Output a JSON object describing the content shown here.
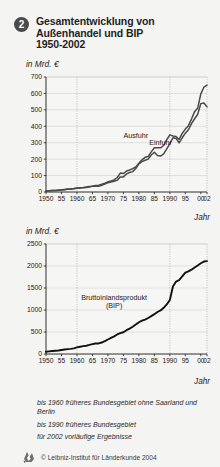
{
  "header": {
    "badge": "2",
    "title_lines": [
      "Gesamtentwicklung von",
      "Außenhandel und BIP",
      "1950-2002"
    ],
    "title_full": "Gesamtentwicklung von Außenhandel und BIP 1950-2002"
  },
  "colors": {
    "background": "#f4f4f2",
    "plot_background": "#f6f6f4",
    "axis": "#1a1a1a",
    "grid": "#c9c9c9",
    "gridline_dotted": "#9a9a9a",
    "series_ausfuhr": "#4a4a4a",
    "series_einfuhr": "#4a4a4a",
    "series_bip": "#111111",
    "badge": "#4b4b4b"
  },
  "notes": [
    "bis 1960 früheres Bundesgebiet ohne Saarland und Berlin",
    "bis 1990 früheres Bundesgebiet",
    "für 2002 vorläufige Ergebnisse"
  ],
  "credit": {
    "text": "© Leibniz-Institut für Länderkunde 2004",
    "logo_icon": "leibniz-logo-icon"
  },
  "chart_data": [
    {
      "id": "aussenhandel",
      "type": "line",
      "title": "",
      "unit_label": "in Mrd. €",
      "xlabel": "Jahr",
      "ylabel": "",
      "xlim": [
        1950,
        2002
      ],
      "ylim": [
        0,
        700
      ],
      "yticks": [
        0,
        100,
        200,
        300,
        400,
        500,
        600,
        700
      ],
      "ytick_labels": [
        "0",
        "100",
        "200",
        "300",
        "400",
        "500",
        "600",
        "700"
      ],
      "xticks": [
        1950,
        1955,
        1960,
        1965,
        1970,
        1975,
        1980,
        1985,
        1990,
        1995,
        2000,
        2002
      ],
      "xtick_labels": [
        "1950",
        "55",
        "1960",
        "65",
        "1970",
        "75",
        "1980",
        "85",
        "1990",
        "95",
        "00",
        "02"
      ],
      "grid": true,
      "vertical_markers": [
        1960,
        1990
      ],
      "legend_position": "inline-annotations",
      "series": [
        {
          "name": "Ausfuhr",
          "label_x": 1979,
          "label_y": 330,
          "x": [
            1950,
            1951,
            1952,
            1953,
            1954,
            1955,
            1956,
            1957,
            1958,
            1959,
            1960,
            1961,
            1962,
            1963,
            1964,
            1965,
            1966,
            1967,
            1968,
            1969,
            1970,
            1971,
            1972,
            1973,
            1974,
            1975,
            1976,
            1977,
            1978,
            1979,
            1980,
            1981,
            1982,
            1983,
            1984,
            1985,
            1986,
            1987,
            1988,
            1989,
            1990,
            1991,
            1992,
            1993,
            1994,
            1995,
            1996,
            1997,
            1998,
            1999,
            2000,
            2001,
            2002
          ],
          "values": [
            4.3,
            7.0,
            8.6,
            9.6,
            11.3,
            13.0,
            15.5,
            18.3,
            19.2,
            21.1,
            24.5,
            26.4,
            27.8,
            30.4,
            33.0,
            35.8,
            39.4,
            41.7,
            46.8,
            53.5,
            62.0,
            67.0,
            73.4,
            88.2,
            115.0,
            112.0,
            128.0,
            134.0,
            142.0,
            152.0,
            175.0,
            196.0,
            211.0,
            216.0,
            244.0,
            269.0,
            270.0,
            269.0,
            283.0,
            318.0,
            348.0,
            341.0,
            338.0,
            320.0,
            357.0,
            383.0,
            404.0,
            444.0,
            489.0,
            511.0,
            597.0,
            638.0,
            651.0
          ]
        },
        {
          "name": "Einfuhr",
          "label_x": 1987,
          "label_y": 285,
          "x": [
            1950,
            1951,
            1952,
            1953,
            1954,
            1955,
            1956,
            1957,
            1958,
            1959,
            1960,
            1961,
            1962,
            1963,
            1964,
            1965,
            1966,
            1967,
            1968,
            1969,
            1970,
            1971,
            1972,
            1973,
            1974,
            1975,
            1976,
            1977,
            1978,
            1979,
            1980,
            1981,
            1982,
            1983,
            1984,
            1985,
            1986,
            1987,
            1988,
            1989,
            1990,
            1991,
            1992,
            1993,
            1994,
            1995,
            1996,
            1997,
            1998,
            1999,
            2000,
            2001,
            2002
          ],
          "values": [
            5.8,
            7.7,
            8.4,
            8.4,
            10.2,
            12.5,
            14.2,
            16.0,
            16.7,
            19.7,
            22.3,
            23.9,
            26.0,
            27.2,
            30.3,
            35.1,
            36.5,
            34.9,
            40.4,
            48.0,
            56.8,
            60.9,
            65.1,
            72.0,
            92.0,
            92.0,
            110.0,
            119.0,
            124.0,
            143.0,
            171.0,
            185.0,
            193.0,
            200.0,
            225.0,
            242.0,
            222.0,
            219.0,
            232.0,
            263.0,
            294.0,
            330.0,
            326.0,
            299.0,
            330.0,
            358.0,
            379.0,
            416.0,
            446.0,
            473.0,
            538.0,
            542.0,
            518.0
          ]
        }
      ]
    },
    {
      "id": "bip",
      "type": "line",
      "title": "",
      "unit_label": "in Mrd. €",
      "xlabel": "Jahr",
      "ylabel": "",
      "xlim": [
        1950,
        2002
      ],
      "ylim": [
        0,
        2500
      ],
      "yticks": [
        0,
        500,
        1000,
        1500,
        2000,
        2500
      ],
      "ytick_labels": [
        "0",
        "500",
        "1000",
        "1500",
        "2000",
        "2500"
      ],
      "xticks": [
        1950,
        1955,
        1960,
        1965,
        1970,
        1975,
        1980,
        1985,
        1990,
        1995,
        2000,
        2002
      ],
      "xtick_labels": [
        "1950",
        "55",
        "1960",
        "65",
        "1970",
        "75",
        "1980",
        "85",
        "1990",
        "95",
        "00",
        "02"
      ],
      "grid": true,
      "vertical_markers": [
        1960,
        1990
      ],
      "legend_position": "inline-annotations",
      "series": [
        {
          "name": "Bruttoinlandsprodukt (BIP)",
          "label_line1": "Bruttoinlandsprodukt",
          "label_line2": "(BIP)",
          "label_x": 1972,
          "label_y": 1230,
          "x": [
            1950,
            1951,
            1952,
            1953,
            1954,
            1955,
            1956,
            1957,
            1958,
            1959,
            1960,
            1961,
            1962,
            1963,
            1964,
            1965,
            1966,
            1967,
            1968,
            1969,
            1970,
            1971,
            1972,
            1973,
            1974,
            1975,
            1976,
            1977,
            1978,
            1979,
            1980,
            1981,
            1982,
            1983,
            1984,
            1985,
            1986,
            1987,
            1988,
            1989,
            1990,
            1991,
            1992,
            1993,
            1994,
            1995,
            1996,
            1997,
            1998,
            1999,
            2000,
            2001,
            2002
          ],
          "values": [
            50,
            59,
            68,
            73,
            79,
            91,
            101,
            110,
            117,
            128,
            149,
            165,
            178,
            188,
            206,
            226,
            239,
            240,
            261,
            292,
            330,
            366,
            400,
            444,
            476,
            495,
            541,
            577,
            620,
            670,
            722,
            757,
            783,
            818,
            862,
            905,
            955,
            990,
            1049,
            1126,
            1228,
            1535,
            1646,
            1679,
            1765,
            1848,
            1878,
            1916,
            1966,
            2012,
            2063,
            2101,
            2110
          ]
        }
      ]
    }
  ]
}
